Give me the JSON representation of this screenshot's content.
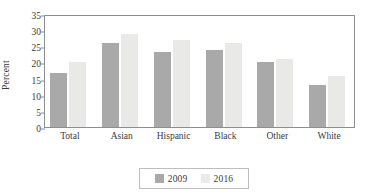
{
  "chart_data": {
    "type": "bar",
    "title": "",
    "xlabel": "",
    "ylabel": "Percent",
    "ylim": [
      0,
      35
    ],
    "yticks": [
      0,
      5,
      10,
      15,
      20,
      25,
      30,
      35
    ],
    "grid": false,
    "legend_position": "bottom",
    "categories": [
      "Total",
      "Asian",
      "Hispanic",
      "Black",
      "Other",
      "White"
    ],
    "series": [
      {
        "name": "2009",
        "color": "#a9a9a9",
        "values": [
          16.8,
          26.0,
          23.2,
          24.0,
          20.1,
          13.0
        ]
      },
      {
        "name": "2016",
        "color": "#e9e9e7",
        "values": [
          20.0,
          28.9,
          26.9,
          26.0,
          21.0,
          15.7
        ]
      }
    ]
  },
  "figure": {
    "ghost_title": ""
  }
}
